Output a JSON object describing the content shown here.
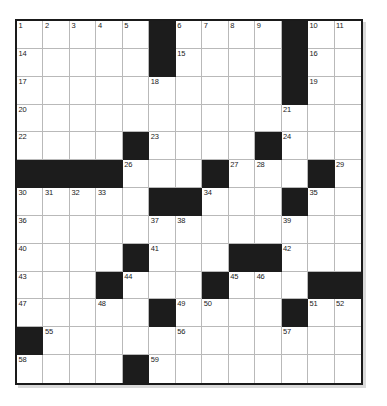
{
  "puzzle": {
    "kind": "crossword-grid",
    "columns": 13,
    "rows": 13,
    "colors": {
      "block": "#1c1c1c",
      "cell": "#ffffff",
      "grid_line": "#b9b9b9",
      "frame": "#1a1a1a",
      "number_text": "#1b1b1b",
      "page_background": "#ffffff"
    },
    "grid": [
      [
        {
          "block": false,
          "number": "1"
        },
        {
          "block": false,
          "number": "2"
        },
        {
          "block": false,
          "number": "3"
        },
        {
          "block": false,
          "number": "4"
        },
        {
          "block": false,
          "number": "5"
        },
        {
          "block": true,
          "number": ""
        },
        {
          "block": false,
          "number": "6"
        },
        {
          "block": false,
          "number": "7"
        },
        {
          "block": false,
          "number": "8"
        },
        {
          "block": false,
          "number": "9"
        },
        {
          "block": true,
          "number": ""
        },
        {
          "block": false,
          "number": "10"
        },
        {
          "block": false,
          "number": "11"
        }
      ],
      [
        {
          "block": false,
          "number": "14"
        },
        {
          "block": false,
          "number": ""
        },
        {
          "block": false,
          "number": ""
        },
        {
          "block": false,
          "number": ""
        },
        {
          "block": false,
          "number": ""
        },
        {
          "block": true,
          "number": ""
        },
        {
          "block": false,
          "number": "15"
        },
        {
          "block": false,
          "number": ""
        },
        {
          "block": false,
          "number": ""
        },
        {
          "block": false,
          "number": ""
        },
        {
          "block": true,
          "number": ""
        },
        {
          "block": false,
          "number": "16"
        },
        {
          "block": false,
          "number": ""
        }
      ],
      [
        {
          "block": false,
          "number": "17"
        },
        {
          "block": false,
          "number": ""
        },
        {
          "block": false,
          "number": ""
        },
        {
          "block": false,
          "number": ""
        },
        {
          "block": false,
          "number": ""
        },
        {
          "block": false,
          "number": "18"
        },
        {
          "block": false,
          "number": ""
        },
        {
          "block": false,
          "number": ""
        },
        {
          "block": false,
          "number": ""
        },
        {
          "block": false,
          "number": ""
        },
        {
          "block": true,
          "number": ""
        },
        {
          "block": false,
          "number": "19"
        },
        {
          "block": false,
          "number": ""
        }
      ],
      [
        {
          "block": false,
          "number": "20"
        },
        {
          "block": false,
          "number": ""
        },
        {
          "block": false,
          "number": ""
        },
        {
          "block": false,
          "number": ""
        },
        {
          "block": false,
          "number": ""
        },
        {
          "block": false,
          "number": ""
        },
        {
          "block": false,
          "number": ""
        },
        {
          "block": false,
          "number": ""
        },
        {
          "block": false,
          "number": ""
        },
        {
          "block": false,
          "number": ""
        },
        {
          "block": false,
          "number": "21"
        },
        {
          "block": false,
          "number": ""
        },
        {
          "block": false,
          "number": ""
        }
      ],
      [
        {
          "block": false,
          "number": "22"
        },
        {
          "block": false,
          "number": ""
        },
        {
          "block": false,
          "number": ""
        },
        {
          "block": false,
          "number": ""
        },
        {
          "block": true,
          "number": ""
        },
        {
          "block": false,
          "number": "23"
        },
        {
          "block": false,
          "number": ""
        },
        {
          "block": false,
          "number": ""
        },
        {
          "block": false,
          "number": ""
        },
        {
          "block": true,
          "number": ""
        },
        {
          "block": false,
          "number": "24"
        },
        {
          "block": false,
          "number": ""
        },
        {
          "block": false,
          "number": ""
        }
      ],
      [
        {
          "block": true,
          "number": ""
        },
        {
          "block": true,
          "number": ""
        },
        {
          "block": true,
          "number": ""
        },
        {
          "block": true,
          "number": ""
        },
        {
          "block": false,
          "number": "26"
        },
        {
          "block": false,
          "number": ""
        },
        {
          "block": false,
          "number": ""
        },
        {
          "block": true,
          "number": ""
        },
        {
          "block": false,
          "number": "27"
        },
        {
          "block": false,
          "number": "28"
        },
        {
          "block": false,
          "number": ""
        },
        {
          "block": true,
          "number": ""
        },
        {
          "block": false,
          "number": "29"
        }
      ],
      [
        {
          "block": false,
          "number": "30"
        },
        {
          "block": false,
          "number": "31"
        },
        {
          "block": false,
          "number": "32"
        },
        {
          "block": false,
          "number": "33"
        },
        {
          "block": false,
          "number": ""
        },
        {
          "block": true,
          "number": ""
        },
        {
          "block": true,
          "number": ""
        },
        {
          "block": false,
          "number": "34"
        },
        {
          "block": false,
          "number": ""
        },
        {
          "block": false,
          "number": ""
        },
        {
          "block": true,
          "number": ""
        },
        {
          "block": false,
          "number": "35"
        },
        {
          "block": false,
          "number": ""
        }
      ],
      [
        {
          "block": false,
          "number": "36"
        },
        {
          "block": false,
          "number": ""
        },
        {
          "block": false,
          "number": ""
        },
        {
          "block": false,
          "number": ""
        },
        {
          "block": false,
          "number": ""
        },
        {
          "block": false,
          "number": "37"
        },
        {
          "block": false,
          "number": "38"
        },
        {
          "block": false,
          "number": ""
        },
        {
          "block": false,
          "number": ""
        },
        {
          "block": false,
          "number": ""
        },
        {
          "block": false,
          "number": "39"
        },
        {
          "block": false,
          "number": ""
        },
        {
          "block": false,
          "number": ""
        }
      ],
      [
        {
          "block": false,
          "number": "40"
        },
        {
          "block": false,
          "number": ""
        },
        {
          "block": false,
          "number": ""
        },
        {
          "block": false,
          "number": ""
        },
        {
          "block": true,
          "number": ""
        },
        {
          "block": false,
          "number": "41"
        },
        {
          "block": false,
          "number": ""
        },
        {
          "block": false,
          "number": ""
        },
        {
          "block": true,
          "number": ""
        },
        {
          "block": true,
          "number": ""
        },
        {
          "block": false,
          "number": "42"
        },
        {
          "block": false,
          "number": ""
        },
        {
          "block": false,
          "number": ""
        }
      ],
      [
        {
          "block": false,
          "number": "43"
        },
        {
          "block": false,
          "number": ""
        },
        {
          "block": false,
          "number": ""
        },
        {
          "block": true,
          "number": ""
        },
        {
          "block": false,
          "number": "44"
        },
        {
          "block": false,
          "number": ""
        },
        {
          "block": false,
          "number": ""
        },
        {
          "block": true,
          "number": ""
        },
        {
          "block": false,
          "number": "45"
        },
        {
          "block": false,
          "number": "46"
        },
        {
          "block": false,
          "number": ""
        },
        {
          "block": true,
          "number": ""
        },
        {
          "block": true,
          "number": ""
        }
      ],
      [
        {
          "block": false,
          "number": "47"
        },
        {
          "block": false,
          "number": ""
        },
        {
          "block": false,
          "number": ""
        },
        {
          "block": false,
          "number": "48"
        },
        {
          "block": false,
          "number": ""
        },
        {
          "block": true,
          "number": ""
        },
        {
          "block": false,
          "number": "49"
        },
        {
          "block": false,
          "number": "50"
        },
        {
          "block": false,
          "number": ""
        },
        {
          "block": false,
          "number": ""
        },
        {
          "block": true,
          "number": ""
        },
        {
          "block": false,
          "number": "51"
        },
        {
          "block": false,
          "number": "52"
        }
      ],
      [
        {
          "block": true,
          "number": ""
        },
        {
          "block": false,
          "number": "55"
        },
        {
          "block": false,
          "number": ""
        },
        {
          "block": false,
          "number": ""
        },
        {
          "block": false,
          "number": ""
        },
        {
          "block": false,
          "number": ""
        },
        {
          "block": false,
          "number": "56"
        },
        {
          "block": false,
          "number": ""
        },
        {
          "block": false,
          "number": ""
        },
        {
          "block": false,
          "number": ""
        },
        {
          "block": false,
          "number": "57"
        },
        {
          "block": false,
          "number": ""
        },
        {
          "block": false,
          "number": ""
        }
      ],
      [
        {
          "block": false,
          "number": "58"
        },
        {
          "block": false,
          "number": ""
        },
        {
          "block": false,
          "number": ""
        },
        {
          "block": false,
          "number": ""
        },
        {
          "block": true,
          "number": ""
        },
        {
          "block": false,
          "number": "59"
        },
        {
          "block": false,
          "number": ""
        },
        {
          "block": false,
          "number": ""
        },
        {
          "block": false,
          "number": ""
        },
        {
          "block": false,
          "number": ""
        },
        {
          "block": false,
          "number": ""
        },
        {
          "block": false,
          "number": ""
        },
        {
          "block": false,
          "number": ""
        }
      ]
    ],
    "extra_numbers": {
      "note_row1_tail": [
        "12",
        "13"
      ],
      "note_row5_tail": [
        "25"
      ],
      "note_row11_tail": [
        "53",
        "54"
      ],
      "note_rows_60_65": [
        "60",
        "61",
        "62",
        "63",
        "64",
        "65"
      ]
    },
    "full_grid": [
      [
        "1",
        "2",
        "3",
        "4",
        "5",
        "#",
        "6",
        "7",
        "8",
        "9",
        "#",
        "10",
        "11",
        "12",
        "13"
      ],
      [
        "14",
        "",
        "",
        "",
        "",
        "#",
        "15",
        "",
        "",
        "",
        "#",
        "16",
        "",
        "",
        ""
      ],
      [
        "17",
        "",
        "",
        "",
        "",
        "18",
        "",
        "",
        "",
        "",
        "#",
        "19",
        "",
        "",
        ""
      ],
      [
        "20",
        "",
        "",
        "",
        "",
        "",
        "",
        "",
        "",
        "",
        "21",
        "",
        "",
        "",
        "#"
      ],
      [
        "22",
        "",
        "",
        "",
        "#",
        "23",
        "",
        "",
        "",
        "#",
        "24",
        "",
        "",
        "",
        "25"
      ],
      [
        "#",
        "#",
        "#",
        "#",
        "26",
        "",
        "",
        "#",
        "27",
        "28",
        "",
        "#",
        "29",
        "",
        ""
      ],
      [
        "30",
        "31",
        "32",
        "33",
        "",
        "#",
        "#",
        "34",
        "",
        "",
        "#",
        "35",
        "",
        "",
        ""
      ],
      [
        "36",
        "",
        "",
        "",
        "",
        "37",
        "38",
        "",
        "",
        "",
        "39",
        "",
        "",
        "",
        ""
      ],
      [
        "40",
        "",
        "",
        "",
        "#",
        "41",
        "",
        "",
        "#",
        "#",
        "42",
        "",
        "",
        "",
        ""
      ],
      [
        "43",
        "",
        "",
        "#",
        "44",
        "",
        "",
        "#",
        "45",
        "46",
        "",
        "#",
        "#",
        "#",
        "#"
      ],
      [
        "47",
        "",
        "",
        "48",
        "",
        "#",
        "49",
        "50",
        "",
        "",
        "#",
        "51",
        "52",
        "53",
        "54"
      ],
      [
        "#",
        "55",
        "",
        "",
        "",
        "",
        "56",
        "",
        "",
        "",
        "57",
        "",
        "",
        "",
        ""
      ],
      [
        "58",
        "",
        "",
        "",
        "#",
        "59",
        "",
        "",
        "",
        "",
        "",
        "",
        "",
        "",
        ""
      ],
      [
        "60",
        "",
        "",
        "",
        "#",
        "61",
        "",
        "",
        "",
        "#",
        "62",
        "",
        "",
        "",
        ""
      ],
      [
        "63",
        "",
        "",
        "",
        "#",
        "64",
        "",
        "",
        "",
        "#",
        "65",
        "",
        "",
        "",
        ""
      ]
    ]
  }
}
